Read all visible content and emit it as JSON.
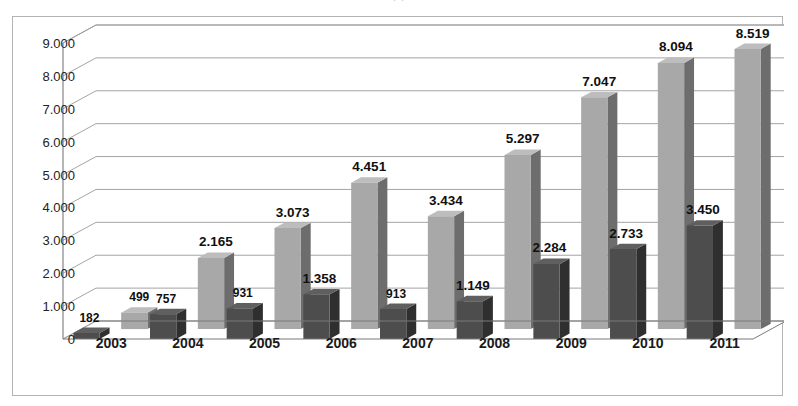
{
  "clipped_title": ". .",
  "colors": {
    "series1_front": "#4d4d4d",
    "series1_side": "#2f2f2f",
    "series1_top": "#5f5f5f",
    "series2_front": "#a8a8a8",
    "series2_side": "#6d6d6d",
    "series2_top": "#bdbdbd",
    "gridline": "#9a9a9a",
    "axis": "#7a7a7a",
    "frame_border": "#b3b3b3",
    "background": "#ffffff",
    "label_text": "#101010"
  },
  "chart_data": {
    "type": "bar",
    "title": "",
    "subtitle": "",
    "xlabel": "",
    "ylabel": "",
    "ylim": [
      0,
      9000
    ],
    "ytick_labels": [
      "0",
      "1.000",
      "2.000",
      "3.000",
      "4.000",
      "5.000",
      "6.000",
      "7.000",
      "8.000",
      "9.000"
    ],
    "ytick_values": [
      0,
      1000,
      2000,
      3000,
      4000,
      5000,
      6000,
      7000,
      8000,
      9000
    ],
    "grid": true,
    "legend": "none",
    "three_d": true,
    "categories": [
      "2003",
      "2004",
      "2005",
      "2006",
      "2007",
      "2008",
      "2009",
      "2010",
      "2011"
    ],
    "series": [
      {
        "name": "series-1-dark",
        "values": [
          182,
          757,
          931,
          1358,
          913,
          1149,
          2284,
          2733,
          3450
        ],
        "labels": [
          "182",
          "757",
          "931",
          "1.358",
          "913",
          "1.149",
          "2.284",
          "2.733",
          "3.450"
        ]
      },
      {
        "name": "series-2-light",
        "values": [
          499,
          2165,
          3073,
          4451,
          3434,
          5297,
          7047,
          8094,
          8519
        ],
        "labels": [
          "499",
          "2.165",
          "3.073",
          "4.451",
          "3.434",
          "5.297",
          "7.047",
          "8.094",
          "8.519"
        ]
      }
    ]
  }
}
